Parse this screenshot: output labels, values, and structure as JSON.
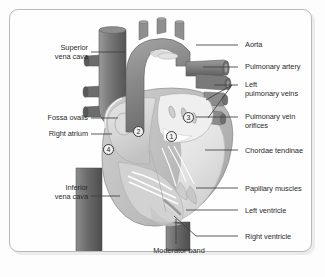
{
  "figure": {
    "width": 325,
    "height": 277,
    "frame_border_color": "#b9b9b9",
    "background_color": "#fefefe"
  },
  "palette": {
    "vessel_dark": "#6f6f6f",
    "vessel_mid": "#8a8a8a",
    "vessel_light": "#a8a8a8",
    "chamber_fill": "#d8d8d8",
    "chamber_light": "#ececec",
    "outline": "#8e8e8e",
    "label_text": "#2b2b2b",
    "leader_line": "#3d3d3d"
  },
  "labels": {
    "left": [
      {
        "id": "superior-vena-cava",
        "text": "Superior\nvena cava",
        "x": 18,
        "y": 43,
        "width": 70,
        "leader_x1": 91,
        "leader_y1": 52,
        "leader_x2": 125,
        "leader_y2": 52
      },
      {
        "id": "fossa-ovalis",
        "text": "Fossa ovalis",
        "x": 14,
        "y": 113,
        "width": 74,
        "leader_x1": 91,
        "leader_y1": 118,
        "leader_x2": 118,
        "leader_y2": 118
      },
      {
        "id": "right-atrium",
        "text": "Right atrium",
        "x": 14,
        "y": 129,
        "width": 74,
        "leader_x1": 91,
        "leader_y1": 134,
        "leader_x2": 112,
        "leader_y2": 134
      },
      {
        "id": "inferior-vena-cava",
        "text": "Inferior\nvena cava",
        "x": 18,
        "y": 183,
        "width": 70,
        "leader_x1": 91,
        "leader_y1": 196,
        "leader_x2": 120,
        "leader_y2": 196
      }
    ],
    "right": [
      {
        "id": "aorta",
        "text": "Aorta",
        "x": 245,
        "y": 40,
        "width": 76,
        "leader_x1": 238,
        "leader_y1": 45,
        "leader_x2": 196,
        "leader_y2": 45
      },
      {
        "id": "pulmonary-artery",
        "text": "Pulmonary artery",
        "x": 245,
        "y": 62,
        "width": 78,
        "leader_x1": 238,
        "leader_y1": 67,
        "leader_x2": 203,
        "leader_y2": 67
      },
      {
        "id": "left-pulmonary-veins",
        "text": "Left\npulmonary veins",
        "x": 245,
        "y": 80,
        "width": 78,
        "leader_x1": 238,
        "leader_y1": 85,
        "leader_x2": 208,
        "leader_y2": 85
      },
      {
        "id": "pulmonary-vein-orifices",
        "text": "Pulmonary vein\norifices",
        "x": 245,
        "y": 105,
        "width": 78,
        "leader_x1": 238,
        "leader_y1": 117,
        "leader_x2": 200,
        "leader_y2": 117
      },
      {
        "id": "chordae-tendinae",
        "text": "Chordae tendinae",
        "x": 245,
        "y": 146,
        "width": 78,
        "leader_x1": 238,
        "leader_y1": 150,
        "leader_x2": 205,
        "leader_y2": 150
      },
      {
        "id": "papillary-muscles",
        "text": "Papillary muscles",
        "x": 245,
        "y": 184,
        "width": 78,
        "leader_x1": 238,
        "leader_y1": 188,
        "leader_x2": 196,
        "leader_y2": 188
      },
      {
        "id": "left-ventricle",
        "text": "Left  ventricle",
        "x": 245,
        "y": 206,
        "width": 78,
        "leader_x1": 238,
        "leader_y1": 210,
        "leader_x2": 186,
        "leader_y2": 210
      },
      {
        "id": "right-ventricle",
        "text": "Right ventricle",
        "x": 245,
        "y": 232,
        "width": 78,
        "leader_x1": 238,
        "leader_y1": 236,
        "leader_x2": 182,
        "leader_y2": 219
      }
    ],
    "bottom": [
      {
        "id": "moderator-band",
        "text": "Moderator band",
        "x": 139,
        "y": 246,
        "width": 80,
        "leader_x1": 176,
        "leader_y1": 244,
        "leader_x2": 176,
        "leader_y2": 223
      }
    ]
  },
  "markers": [
    {
      "id": "marker-1",
      "number": "1",
      "x": 166,
      "y": 131
    },
    {
      "id": "marker-2",
      "number": "2",
      "x": 133,
      "y": 126
    },
    {
      "id": "marker-3",
      "number": "3",
      "x": 183,
      "y": 112
    },
    {
      "id": "marker-4",
      "number": "4",
      "x": 103,
      "y": 144
    }
  ]
}
